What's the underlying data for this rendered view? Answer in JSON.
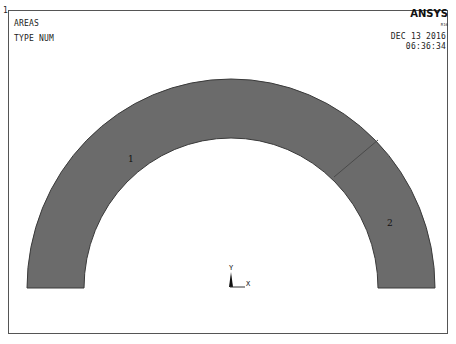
{
  "window": {
    "number": "1",
    "title": "AREAS",
    "subtitle": "TYPE NUM",
    "logo": "ANSYS",
    "version": "R16",
    "date": "DEC 13 2016",
    "time": "06:36:34"
  },
  "plot": {
    "fill_color": "#6b6b6b",
    "edge_color": "#333333",
    "background": "#ffffff",
    "areas": [
      {
        "id": "1",
        "label": "1"
      },
      {
        "id": "2",
        "label": "2"
      }
    ],
    "triad": {
      "y_label": "Y",
      "x_label": "X"
    }
  }
}
